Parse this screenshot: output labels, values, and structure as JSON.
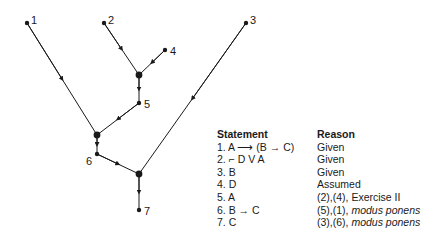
{
  "diagram": {
    "nodes": [
      {
        "id": "1",
        "label": "1",
        "x": 27,
        "y": 23
      },
      {
        "id": "2",
        "label": "2",
        "x": 104,
        "y": 23
      },
      {
        "id": "3",
        "label": "3",
        "x": 246,
        "y": 23
      },
      {
        "id": "4",
        "label": "4",
        "x": 165,
        "y": 50
      },
      {
        "id": "5",
        "label": "5",
        "x": 139,
        "y": 103
      },
      {
        "id": "6",
        "label": "6",
        "x": 97,
        "y": 154
      },
      {
        "id": "7",
        "label": "7",
        "x": 139,
        "y": 210
      }
    ],
    "junctions": [
      {
        "id": "j1",
        "x": 139,
        "y": 75
      },
      {
        "id": "j2",
        "x": 97,
        "y": 135
      },
      {
        "id": "j3",
        "x": 139,
        "y": 174
      }
    ],
    "edges": [
      {
        "from": "1",
        "to": "j2"
      },
      {
        "from": "2",
        "to": "j1"
      },
      {
        "from": "4",
        "to": "j1"
      },
      {
        "from": "j1",
        "to": "5"
      },
      {
        "from": "5",
        "to": "j2"
      },
      {
        "from": "j2",
        "to": "6"
      },
      {
        "from": "6",
        "to": "j3"
      },
      {
        "from": "3",
        "to": "j3"
      },
      {
        "from": "j3",
        "to": "7"
      }
    ]
  },
  "proof": {
    "headers": {
      "statement": "Statement",
      "reason": "Reason"
    },
    "rows": [
      {
        "statement": "1. A ⟶ (B → C)",
        "reason": "Given",
        "reason_extra": ""
      },
      {
        "statement": "2. ⌐ D V A",
        "reason": "Given",
        "reason_extra": ""
      },
      {
        "statement": "3. B",
        "reason": "Given",
        "reason_extra": ""
      },
      {
        "statement": "4. D",
        "reason": "Assumed",
        "reason_extra": ""
      },
      {
        "statement": "5. A",
        "reason": "(2),(4), Exercise II",
        "reason_extra": ""
      },
      {
        "statement": "6. B → C",
        "reason": "(5),(1), ",
        "reason_extra": "modus ponens"
      },
      {
        "statement": "7. C",
        "reason": "(3),(6), ",
        "reason_extra": "modus ponens"
      }
    ]
  }
}
